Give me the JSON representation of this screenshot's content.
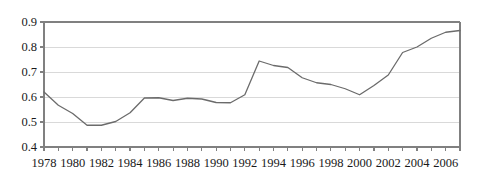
{
  "chart_data": {
    "type": "line",
    "title": "",
    "subtitle": "",
    "xlabel": "",
    "ylabel": "",
    "xlim": [
      1978,
      2007
    ],
    "ylim": [
      0.4,
      0.9
    ],
    "grid": true,
    "grid_axis": "y",
    "legend": false,
    "legend_position": "none",
    "line_color": "#6b6b6b",
    "axis_color": "#808080",
    "grid_color": "#d9d9d9",
    "text_color": "#1a1a1a",
    "yticks": [
      0.4,
      0.5,
      0.6,
      0.7,
      0.8,
      0.9
    ],
    "ytick_labels": [
      "0.4",
      "0.5",
      "0.6",
      "0.7",
      "0.8",
      "0.9"
    ],
    "xticks": [
      1978,
      1979,
      1980,
      1981,
      1982,
      1983,
      1984,
      1985,
      1986,
      1987,
      1988,
      1989,
      1990,
      1991,
      1992,
      1993,
      1994,
      1995,
      1996,
      1997,
      1998,
      1999,
      2000,
      2001,
      2002,
      2003,
      2004,
      2005,
      2006,
      2007
    ],
    "xtick_labels_shown": [
      "1978",
      "1980",
      "1982",
      "1984",
      "1986",
      "1988",
      "1990",
      "1992",
      "1994",
      "1996",
      "1998",
      "2000",
      "2002",
      "2004",
      "2006"
    ],
    "xtick_label_years": [
      1978,
      1980,
      1982,
      1984,
      1986,
      1988,
      1990,
      1992,
      1994,
      1996,
      1998,
      2000,
      2002,
      2004,
      2006
    ],
    "x": [
      1978,
      1979,
      1980,
      1981,
      1982,
      1983,
      1984,
      1985,
      1986,
      1987,
      1988,
      1989,
      1990,
      1991,
      1992,
      1993,
      1994,
      1995,
      1996,
      1997,
      1998,
      1999,
      2000,
      2001,
      2002,
      2003,
      2004,
      2005,
      2006,
      2007
    ],
    "values": [
      0.62,
      0.567,
      0.534,
      0.487,
      0.487,
      0.502,
      0.537,
      0.596,
      0.597,
      0.586,
      0.595,
      0.592,
      0.578,
      0.577,
      0.609,
      0.744,
      0.726,
      0.718,
      0.677,
      0.657,
      0.65,
      0.633,
      0.609,
      0.646,
      0.688,
      0.778,
      0.8,
      0.835,
      0.859,
      0.866
    ],
    "series": [
      {
        "name": "series-1",
        "values": [
          0.62,
          0.567,
          0.534,
          0.487,
          0.487,
          0.502,
          0.537,
          0.596,
          0.597,
          0.586,
          0.595,
          0.592,
          0.578,
          0.577,
          0.609,
          0.744,
          0.726,
          0.718,
          0.677,
          0.657,
          0.65,
          0.633,
          0.609,
          0.646,
          0.688,
          0.778,
          0.8,
          0.835,
          0.859,
          0.866
        ]
      }
    ],
    "annotations": []
  },
  "axes": {
    "y_axis_name": "y-axis",
    "x_axis_name": "x-axis"
  }
}
